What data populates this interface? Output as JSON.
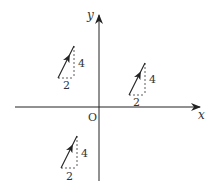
{
  "diagram": {
    "type": "vector-translation-diagram",
    "colors": {
      "line": "#222222",
      "dash": "#333333",
      "text": "#333333",
      "background": "#ffffff"
    },
    "axes": {
      "x_label": "x",
      "y_label": "y",
      "origin_label": "O"
    },
    "vectors": [
      {
        "id": "upper-left",
        "quadrant": "II",
        "run": 2,
        "rise": 4,
        "run_label": "2",
        "rise_label": "4"
      },
      {
        "id": "right",
        "quadrant": "I",
        "run": 2,
        "rise": 4,
        "run_label": "2",
        "rise_label": "4"
      },
      {
        "id": "lower-left",
        "quadrant": "III",
        "run": 2,
        "rise": 4,
        "run_label": "2",
        "rise_label": "4"
      }
    ]
  }
}
